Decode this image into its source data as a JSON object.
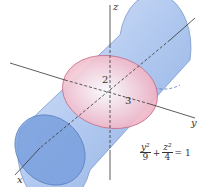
{
  "diagram": {
    "axes": {
      "x": "x",
      "y": "y",
      "z": "z"
    },
    "semi_axes": {
      "z_label": "2",
      "y_label": "3"
    },
    "equation": {
      "term1_num": "y²",
      "term1_den": "9",
      "plus": "+",
      "term2_num": "z²",
      "term2_den": "4",
      "rhs": "= 1"
    },
    "colors": {
      "cylinder": "#9ab8e8",
      "cross_section": "#f0b8c8",
      "axes": "#333333"
    }
  }
}
